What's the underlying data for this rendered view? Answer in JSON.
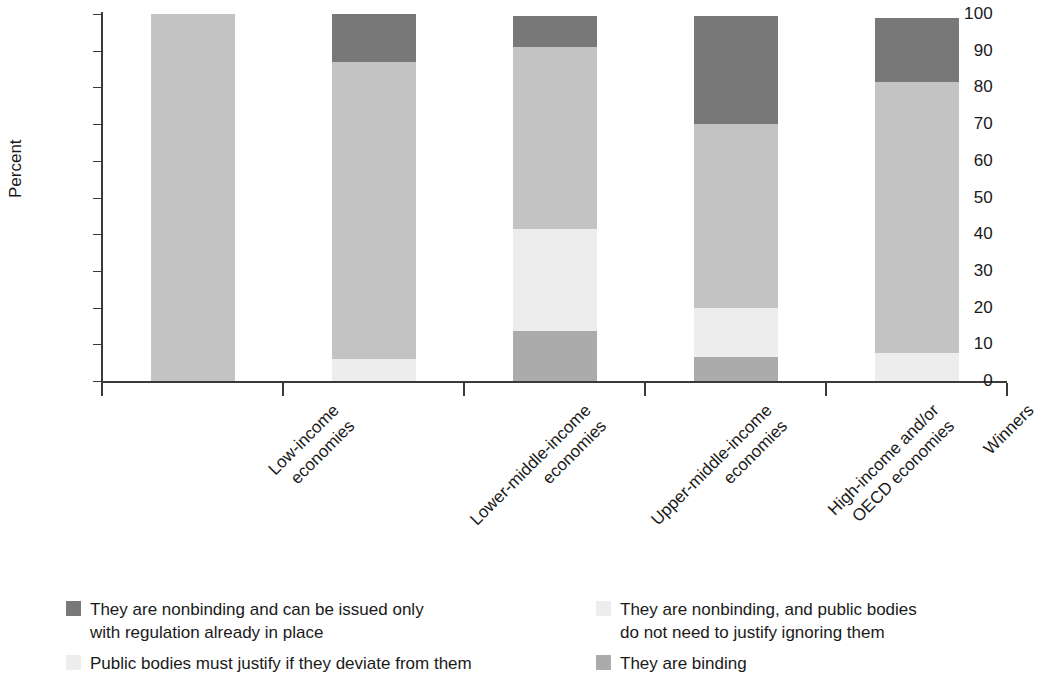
{
  "chart_data": {
    "type": "bar",
    "subtype": "stacked-bar-100-percent",
    "title": "",
    "subtitle": "",
    "xlabel": "",
    "ylabel": "Percent",
    "ylim": [
      0,
      100
    ],
    "yticks": [
      0,
      10,
      20,
      30,
      40,
      50,
      60,
      70,
      80,
      90,
      100
    ],
    "ytick_labels": [
      "0",
      "10",
      "20",
      "30",
      "40",
      "50",
      "60",
      "70",
      "80",
      "90",
      "100"
    ],
    "grid": false,
    "legend_position": "bottom",
    "categories": [
      "Low-income\neconomies",
      "Lower-middle-income\neconomies",
      "Upper-middle-income\neconomies",
      "High-income and/or\nOECD economies",
      "Winners"
    ],
    "series": [
      {
        "name": "They are nonbinding and can be issued only with regulation already in place",
        "color": "#787878",
        "values": [
          0,
          13,
          8.5,
          29.5,
          17.5
        ]
      },
      {
        "name": "They are nonbinding, and public bodies do not need to justify ignoring them",
        "color": "#c3c3c3",
        "values": [
          100,
          81,
          49.5,
          50,
          74
        ]
      },
      {
        "name": "Public bodies must justify if they deviate from them",
        "color": "#ededed",
        "values": [
          0,
          6,
          28,
          13.5,
          7.5
        ]
      },
      {
        "name": "They are binding",
        "color": "#ababab",
        "values": [
          0,
          0,
          13.5,
          6.5,
          0
        ]
      }
    ],
    "stack_order_top_to_bottom": [
      "They are nonbinding and can be issued only with regulation already in place",
      "They are nonbinding, and public bodies do not need to justify ignoring them",
      "Public bodies must justify if they deviate from them",
      "They are binding"
    ],
    "bar_totals": [
      100,
      100,
      99.5,
      99.5,
      99
    ]
  },
  "legend": {
    "items": [
      {
        "label": "They are nonbinding and can be issued only\nwith regulation already in place",
        "color": "#787878"
      },
      {
        "label": "They are nonbinding, and public bodies\ndo not need to justify ignoring them",
        "color": "#ededed"
      },
      {
        "label": "Public bodies must justify if they deviate from them",
        "color": "#ededed"
      },
      {
        "label": "They are binding",
        "color": "#ababab"
      }
    ]
  },
  "colors": {
    "dark_gray": "#787878",
    "medium_gray": "#c3c3c3",
    "light_gray": "#ededed",
    "binding_gray": "#ababab",
    "axis": "#3a3a3a",
    "text": "#1a1a1a",
    "background": "#ffffff"
  }
}
